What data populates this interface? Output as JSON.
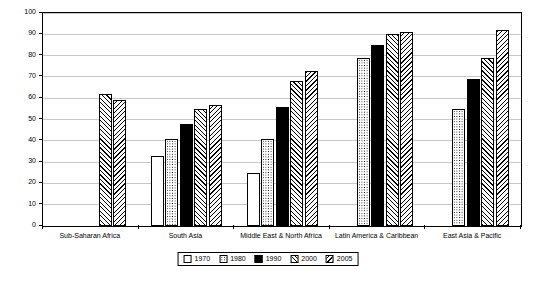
{
  "chart_data": {
    "type": "bar",
    "title": "",
    "xlabel": "",
    "ylabel": "percent",
    "ylim": [
      0,
      100
    ],
    "ytick_step": 10,
    "yticks": [
      "0",
      "10",
      "20",
      "30",
      "40",
      "50",
      "60",
      "70",
      "80",
      "90",
      "100"
    ],
    "grid": true,
    "legend_position": "bottom",
    "categories": [
      "Sub-Saharan Africa",
      "South Asia",
      "Middle East & North Africa",
      "Latin America & Caribbean",
      "East Asia & Pacific"
    ],
    "series": [
      {
        "name": "1970",
        "fill": "dots-sparse",
        "values": [
          null,
          33,
          25,
          null,
          null
        ]
      },
      {
        "name": "1980",
        "fill": "dots-dense",
        "values": [
          null,
          41,
          41,
          79,
          55
        ]
      },
      {
        "name": "1990",
        "fill": "solid-black",
        "values": [
          null,
          48,
          56,
          85,
          69
        ]
      },
      {
        "name": "2000",
        "fill": "hatch-left",
        "values": [
          62,
          55,
          68,
          90,
          79
        ]
      },
      {
        "name": "2005",
        "fill": "hatch-right",
        "values": [
          59,
          57,
          73,
          91,
          92
        ]
      }
    ]
  },
  "legend": {
    "items": [
      {
        "label": "1970"
      },
      {
        "label": "1980"
      },
      {
        "label": "1990"
      },
      {
        "label": "2000"
      },
      {
        "label": "2005"
      }
    ]
  },
  "colors": {
    "axis": "#000000",
    "grid": "#c8c8c8",
    "background": "#ffffff",
    "series_black": "#000000"
  }
}
